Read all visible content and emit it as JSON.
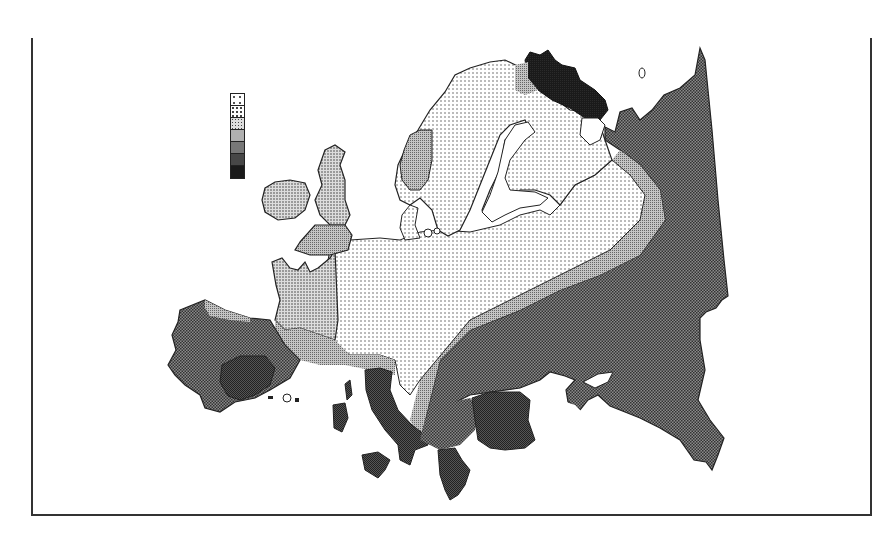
{
  "map": {
    "type": "choropleth",
    "region": "Europe",
    "title": "",
    "legend": {
      "classes": [
        {
          "index": 1,
          "pattern": "sparse-dots",
          "fill": "#f4f4f4"
        },
        {
          "index": 2,
          "pattern": "dots",
          "fill": "#e4e4e4"
        },
        {
          "index": 3,
          "pattern": "dense-dots",
          "fill": "#cfcfcf"
        },
        {
          "index": 4,
          "pattern": "fine-grid",
          "fill": "#a9a9a9"
        },
        {
          "index": 5,
          "pattern": "checker",
          "fill": "#6e6e6e"
        },
        {
          "index": 6,
          "pattern": "dark-checker",
          "fill": "#454545"
        },
        {
          "index": 7,
          "pattern": "solid-dark",
          "fill": "#1a1a1a"
        }
      ],
      "labels_visible": false
    },
    "regions": [
      {
        "name": "Scandinavia interior",
        "class": 2
      },
      {
        "name": "Western Norway",
        "class": 4
      },
      {
        "name": "Kola Peninsula",
        "class": 7
      },
      {
        "name": "Northern Finland edge",
        "class": 4
      },
      {
        "name": "Finland and Baltic",
        "class": 2
      },
      {
        "name": "Central/Eastern Europe core",
        "class": 2
      },
      {
        "name": "France and Low Countries",
        "class": 3
      },
      {
        "name": "Ireland",
        "class": 3
      },
      {
        "name": "Scotland / Northern England",
        "class": 3
      },
      {
        "name": "Southern England",
        "class": 4
      },
      {
        "name": "Southern France / Alps band",
        "class": 4
      },
      {
        "name": "Iberia",
        "class": 5
      },
      {
        "name": "Northern Iberia coast",
        "class": 4
      },
      {
        "name": "Southern Spain",
        "class": 6
      },
      {
        "name": "Italy",
        "class": 6
      },
      {
        "name": "Corsica / Sardinia / Sicily",
        "class": 6
      },
      {
        "name": "Greece",
        "class": 6
      },
      {
        "name": "Romania / Bulgaria",
        "class": 6
      },
      {
        "name": "Balkan band",
        "class": 5
      },
      {
        "name": "Ukraine / Russia band",
        "class": 3
      },
      {
        "name": "Russia (east)",
        "class": 5
      },
      {
        "name": "Caucasus",
        "class": 5
      }
    ]
  }
}
